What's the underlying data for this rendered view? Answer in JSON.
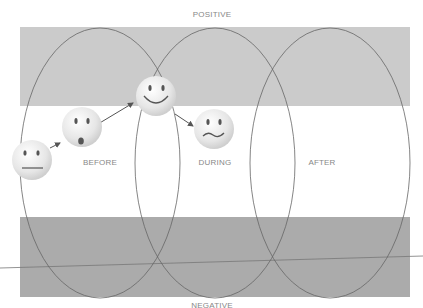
{
  "labels": {
    "top": "POSITIVE",
    "bottom": "NEGATIVE",
    "phases": [
      "BEFORE",
      "DURING",
      "AFTER"
    ]
  },
  "colors": {
    "band": "#c8c8c8",
    "band_dark": "#a9a9a9",
    "ellipse_stroke": "#666666",
    "face": "#ececec"
  },
  "faces": [
    {
      "name": "neutral",
      "mood": "neutral"
    },
    {
      "name": "surprised",
      "mood": "surprised"
    },
    {
      "name": "happy",
      "mood": "happy"
    },
    {
      "name": "uneasy",
      "mood": "uneasy"
    }
  ]
}
